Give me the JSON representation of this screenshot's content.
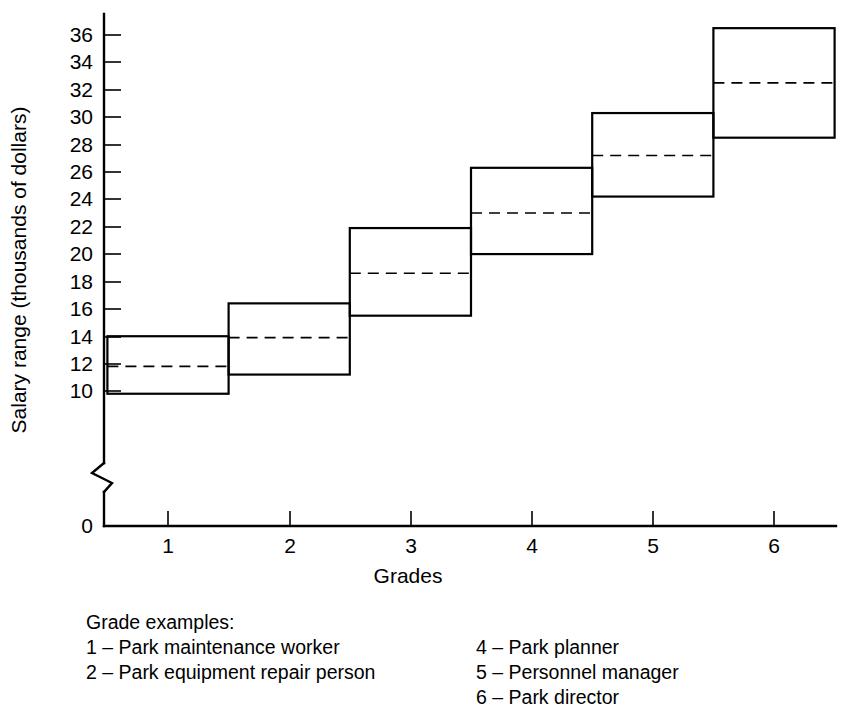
{
  "chart_data": {
    "type": "bar",
    "title": "",
    "xlabel": "Grades",
    "ylabel": "Salary range (thousands of dollars)",
    "categories": [
      "1",
      "2",
      "3",
      "4",
      "5",
      "6"
    ],
    "x_tick_labels": [
      "1",
      "2",
      "3",
      "4",
      "5",
      "6"
    ],
    "y_tick_labels": [
      "0",
      "10",
      "12",
      "14",
      "16",
      "18",
      "20",
      "22",
      "24",
      "26",
      "28",
      "30",
      "32",
      "34",
      "36"
    ],
    "y_axis_break": true,
    "y_axis_break_between": [
      0,
      10
    ],
    "ylim": [
      9.0,
      37.5
    ],
    "grid": false,
    "legend_position": "below-plot",
    "series": [
      {
        "name": "range_min",
        "values": [
          9.8,
          11.2,
          15.5,
          20.0,
          24.2,
          28.5
        ]
      },
      {
        "name": "midpoint",
        "values": [
          11.8,
          13.9,
          18.6,
          23.0,
          27.2,
          32.5
        ]
      },
      {
        "name": "range_max",
        "values": [
          14.0,
          16.4,
          21.9,
          26.3,
          30.3,
          36.5
        ]
      }
    ],
    "boxes": [
      {
        "grade": "1",
        "min": 9.8,
        "mid": 11.8,
        "max": 14.0
      },
      {
        "grade": "2",
        "min": 11.2,
        "mid": 13.9,
        "max": 16.4
      },
      {
        "grade": "3",
        "min": 15.5,
        "mid": 18.6,
        "max": 21.9
      },
      {
        "grade": "4",
        "min": 20.0,
        "mid": 23.0,
        "max": 26.3
      },
      {
        "grade": "5",
        "min": 24.2,
        "mid": 27.2,
        "max": 30.3
      },
      {
        "grade": "6",
        "min": 28.5,
        "mid": 32.5,
        "max": 36.5
      }
    ]
  },
  "legend": {
    "title": "Grade examples:",
    "left_items": [
      "1 – Park maintenance worker",
      "2 – Park equipment repair person"
    ],
    "right_items": [
      "4 – Park planner",
      "5 – Personnel manager",
      "6 – Park director"
    ]
  },
  "colors": {
    "ink": "#000000",
    "background": "#ffffff"
  }
}
